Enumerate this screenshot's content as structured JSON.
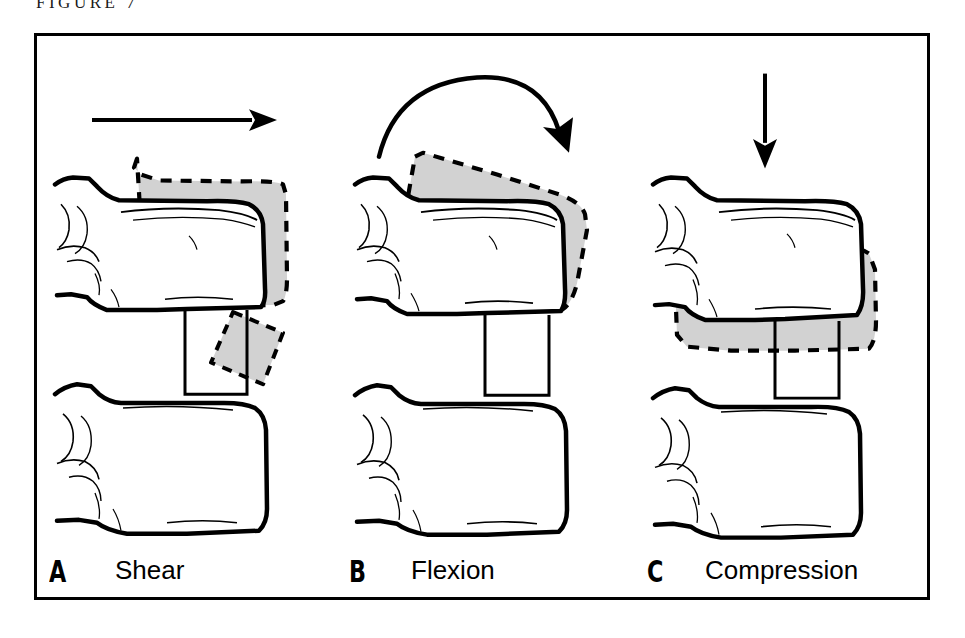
{
  "caption": {
    "text": "FIGURE 7"
  },
  "figure": {
    "colors": {
      "outline": "#000000",
      "displaced_fill": "#d2d2d2",
      "background": "#ffffff",
      "frame": "#000000"
    },
    "panels": [
      {
        "id": "a",
        "letter": "A",
        "name": "Shear",
        "arrow": "horizontal-right-arrow",
        "displaced_outline": "dashed",
        "displaced_fill": "#d2d2d2",
        "disc_marker": "rotated-square",
        "upper_vertebra": "solid-outline",
        "lower_vertebra": "solid-outline"
      },
      {
        "id": "b",
        "letter": "B",
        "name": "Flexion",
        "arrow": "curved-clockwise-arrow",
        "displaced_outline": "dashed",
        "displaced_fill": "#d2d2d2",
        "disc_marker": "rectangle",
        "upper_vertebra": "solid-outline",
        "lower_vertebra": "solid-outline"
      },
      {
        "id": "c",
        "letter": "C",
        "name": "Compression",
        "arrow": "vertical-down-arrow",
        "displaced_outline": "dashed",
        "displaced_fill": "#d2d2d2",
        "disc_marker": "rectangle",
        "upper_vertebra": "solid-outline",
        "lower_vertebra": "solid-outline"
      }
    ]
  }
}
